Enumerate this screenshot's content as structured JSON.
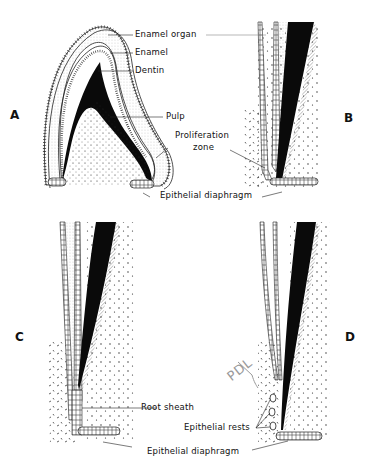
{
  "figure": {
    "panels": [
      {
        "id": "A",
        "letter": "A"
      },
      {
        "id": "B",
        "letter": "B"
      },
      {
        "id": "C",
        "letter": "C"
      },
      {
        "id": "D",
        "letter": "D"
      }
    ],
    "labels": {
      "enamel_organ": "Enamel organ",
      "enamel": "Enamel",
      "dentin": "Dentin",
      "pulp": "Pulp",
      "proliferation_zone_line1": "Proliferation",
      "proliferation_zone_line2": "zone",
      "epithelial_diaphragm_top": "Epithelial diaphragm",
      "root_sheath": "Root sheath",
      "epithelial_rests": "Epithelial rests",
      "epithelial_diaphragm_bottom": "Epithelial diaphragm"
    },
    "annotation": {
      "handwritten": "PDL"
    },
    "colors": {
      "ink": "#111111",
      "background": "#ffffff",
      "pencil": "#9a9a9a"
    }
  }
}
